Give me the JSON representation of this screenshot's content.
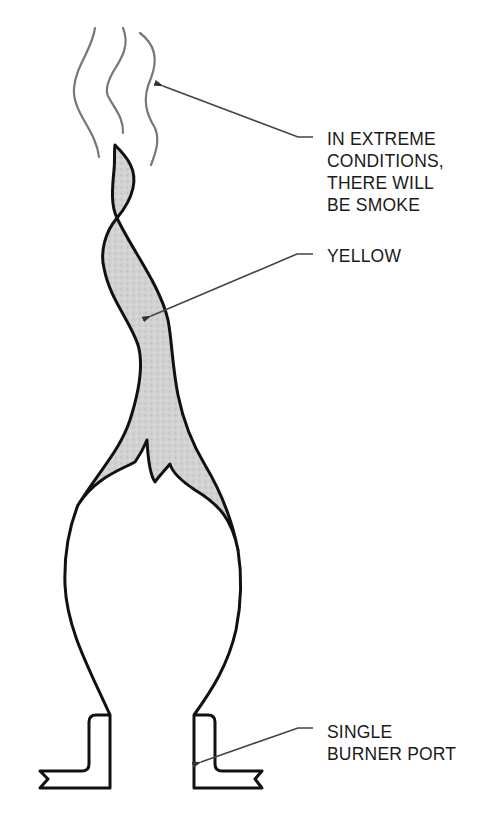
{
  "diagram": {
    "colors": {
      "outline": "#111111",
      "smoke": "#777777",
      "leader": "#444444",
      "yellow_fill": "#cfcfcf",
      "background": "#ffffff"
    },
    "labels": {
      "smoke": {
        "lines": [
          "IN EXTREME",
          "CONDITIONS,",
          "THERE WILL",
          "BE SMOKE"
        ],
        "points_to": "smoke-wisps"
      },
      "yellow": {
        "lines": [
          "YELLOW"
        ],
        "points_to": "yellow-flame-region"
      },
      "burner_port": {
        "lines": [
          "SINGLE",
          "BURNER PORT"
        ],
        "points_to": "right-burner-port-wall"
      }
    }
  }
}
